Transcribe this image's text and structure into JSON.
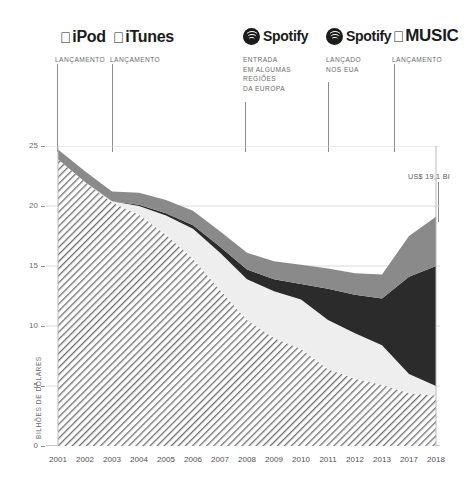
{
  "logos": [
    {
      "name": "ipod",
      "mark": "apple",
      "text": "iPod",
      "left": 60
    },
    {
      "name": "itunes",
      "mark": "apple",
      "text": "iTunes",
      "left": 113
    },
    {
      "name": "spotify-eu",
      "mark": "spotify",
      "text": "Spotify",
      "left": 243
    },
    {
      "name": "spotify-usa",
      "mark": "spotify",
      "text": "Spotify",
      "left": 326
    },
    {
      "name": "apple-music",
      "mark": "apple",
      "text": "MUSIC",
      "left": 393
    }
  ],
  "annotations": [
    {
      "name": "ipod-launch",
      "text": "LANÇAMENTO",
      "x": 57,
      "text_x": 55,
      "text_y": 55,
      "line_top": 64,
      "line_bottom": 152
    },
    {
      "name": "itunes-launch",
      "text": "LANÇAMENTO",
      "x": 112,
      "text_x": 110,
      "text_y": 55,
      "line_top": 64,
      "line_bottom": 152
    },
    {
      "name": "spotify-europe",
      "text": "ENTRADA\nEM ALGUMAS\nREGIÕES\nDA EUROPA",
      "x": 245,
      "text_x": 243,
      "text_y": 55,
      "line_top": 102,
      "line_bottom": 152
    },
    {
      "name": "spotify-usa-launch",
      "text": "LANÇADO\nNOS EUA",
      "x": 328,
      "text_x": 326,
      "text_y": 55,
      "line_top": 82,
      "line_bottom": 152
    },
    {
      "name": "apple-music-launch",
      "text": "LANÇAMENTO",
      "x": 394,
      "text_x": 392,
      "text_y": 55,
      "line_top": 64,
      "line_bottom": 152
    }
  ],
  "callout": {
    "name": "value-callout",
    "text": "US$ 19,1 BI",
    "text_x": 408,
    "text_y": 172,
    "line_x": 438,
    "line_top": 182,
    "line_bottom": 222
  },
  "chart_data": {
    "type": "area",
    "title": "",
    "xlabel": "",
    "ylabel": "BILHÕES DE DÓLARES",
    "ylim": [
      0,
      25
    ],
    "yticks": [
      0,
      5,
      10,
      15,
      20,
      25
    ],
    "grid": true,
    "legend": "none",
    "categories": [
      "2001",
      "2002",
      "2003",
      "2004",
      "2005",
      "2006",
      "2007",
      "2008",
      "2009",
      "2010",
      "2011",
      "2012",
      "2013",
      "2017",
      "2018"
    ],
    "stacked": true,
    "series": [
      {
        "name": "Físico",
        "key": "physical",
        "fill": "hatch",
        "color": "#6f6f71",
        "values": [
          23.9,
          22.0,
          20.3,
          19.3,
          17.6,
          15.6,
          13.0,
          10.5,
          9.0,
          8.1,
          6.4,
          5.6,
          5.1,
          4.4,
          4.2
        ]
      },
      {
        "name": "Download",
        "key": "download",
        "fill": "solid",
        "color": "#eeeeee",
        "values": [
          0.0,
          0.0,
          0.1,
          0.7,
          1.6,
          2.5,
          3.1,
          3.4,
          3.9,
          4.1,
          4.1,
          3.8,
          3.3,
          1.6,
          0.8
        ]
      },
      {
        "name": "Streaming",
        "key": "streaming",
        "fill": "solid",
        "color": "#2b2b2b",
        "values": [
          0.0,
          0.0,
          0.0,
          0.1,
          0.2,
          0.3,
          0.5,
          0.8,
          1.0,
          1.3,
          2.6,
          3.2,
          3.9,
          8.1,
          10.0
        ]
      },
      {
        "name": "Direitos de execução e sincronização",
        "key": "other",
        "fill": "solid",
        "color": "#8a8a8a",
        "values": [
          0.8,
          0.9,
          0.8,
          1.0,
          1.1,
          1.2,
          1.3,
          1.4,
          1.5,
          1.6,
          1.7,
          1.8,
          2.0,
          3.4,
          4.1
        ]
      }
    ],
    "totals": [
      24.7,
      22.9,
      21.2,
      21.1,
      20.5,
      19.6,
      17.9,
      16.1,
      15.4,
      15.1,
      14.8,
      14.4,
      14.3,
      17.5,
      19.1
    ],
    "highlight": {
      "year": "2018",
      "value": 19.1,
      "label": "US$ 19,1 BI"
    }
  }
}
